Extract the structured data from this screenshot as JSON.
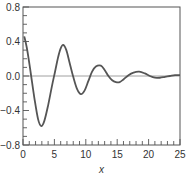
{
  "chart_data": {
    "type": "line",
    "title": "",
    "xlabel": "x",
    "ylabel": "",
    "xlim": [
      0,
      25
    ],
    "ylim": [
      -0.8,
      0.8
    ],
    "x_ticks": [
      0,
      5,
      10,
      15,
      20,
      25
    ],
    "x_tick_labels": [
      "0",
      "5",
      "10",
      "15",
      "20",
      "25"
    ],
    "x_minor_step": 1,
    "y_ticks": [
      -0.8,
      -0.4,
      0.0,
      0.4,
      0.8
    ],
    "y_tick_labels": [
      "−0.8",
      "−0.4",
      "0.0",
      "0.4",
      "0.8"
    ],
    "y_minor_step": 0.1,
    "grid": false,
    "reference_line_y": 0.0,
    "legend": "none",
    "series": [
      {
        "name": "damped oscillation",
        "color": "#555555",
        "x": [
          0.2,
          0.6,
          1.0,
          1.3,
          1.8,
          2.4,
          2.9,
          3.4,
          4.0,
          4.6,
          5.1,
          5.6,
          6.0,
          6.4,
          6.9,
          7.4,
          8.0,
          8.6,
          9.2,
          9.8,
          10.4,
          11.0,
          11.6,
          12.4,
          13.0,
          13.6,
          14.2,
          14.8,
          15.4,
          16.0,
          16.8,
          17.6,
          18.5,
          19.4,
          20.2,
          21.0,
          21.8,
          22.6,
          23.4,
          24.2,
          25.0
        ],
        "y": [
          0.46,
          0.33,
          0.15,
          0.0,
          -0.25,
          -0.5,
          -0.58,
          -0.52,
          -0.34,
          -0.12,
          0.05,
          0.22,
          0.32,
          0.36,
          0.3,
          0.16,
          -0.01,
          -0.15,
          -0.21,
          -0.17,
          -0.06,
          0.05,
          0.11,
          0.12,
          0.07,
          0.0,
          -0.05,
          -0.07,
          -0.07,
          -0.04,
          0.01,
          0.04,
          0.05,
          0.03,
          0.0,
          -0.02,
          -0.02,
          -0.01,
          0.0,
          0.01,
          0.01
        ]
      }
    ]
  }
}
